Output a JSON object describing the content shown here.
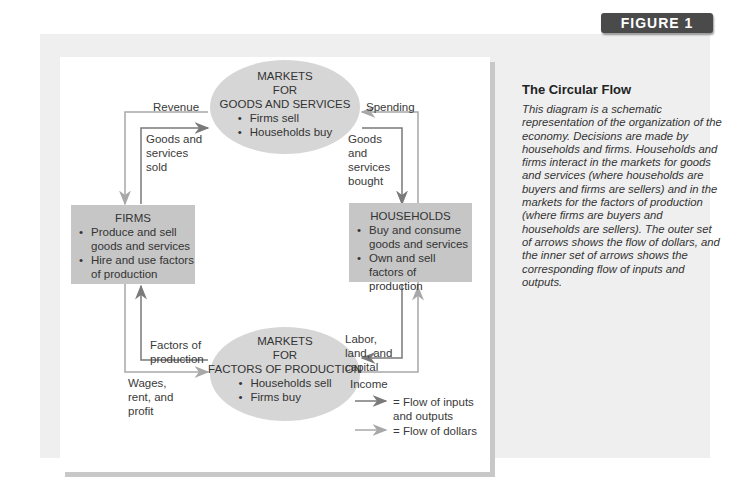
{
  "figure_badge": "FIGURE 1",
  "caption": {
    "title": "The Circular Flow",
    "body": "This diagram is a schematic representation of the organization of the economy. Decisions are made by households and firms. Households and firms interact in the markets for goods and services (where households are buyers and firms are sellers) and in the markets for the factors of production (where firms are buyers and households are sellers). The outer set of arrows shows the flow of dollars, and the inner set of arrows shows the corresponding flow of inputs and outputs."
  },
  "nodes": {
    "goods_market": {
      "title_lines": [
        "MARKETS",
        "FOR",
        "GOODS AND SERVICES"
      ],
      "bullets": [
        "Firms sell",
        "Households buy"
      ]
    },
    "factor_market": {
      "title_lines": [
        "MARKETS",
        "FOR",
        "FACTORS OF PRODUCTION"
      ],
      "bullets": [
        "Households sell",
        "Firms buy"
      ]
    },
    "firms": {
      "title": "FIRMS",
      "bullets": [
        "Produce and sell goods and services",
        "Hire and use factors of production"
      ]
    },
    "households": {
      "title": "HOUSEHOLDS",
      "bullets": [
        "Buy and consume goods and services",
        "Own and sell factors of production"
      ]
    }
  },
  "flow_labels": {
    "revenue": "Revenue",
    "spending": "Spending",
    "goods_sold": "Goods and services sold",
    "goods_bought": "Goods and services bought",
    "factors_of_production": "Factors of production",
    "labor_land_capital": "Labor, land, and capital",
    "wages_rent_profit": "Wages, rent, and profit",
    "income": "Income"
  },
  "legend": {
    "inputs_outputs": "= Flow of inputs and outputs",
    "dollars": "= Flow of dollars"
  },
  "colors": {
    "inner_arrow": "#7a7a7a",
    "outer_arrow": "#a8a8a8",
    "box_fill": "#c6c6c6",
    "oval_fill": "#d6d6d6",
    "badge": "#4a4a4a"
  }
}
